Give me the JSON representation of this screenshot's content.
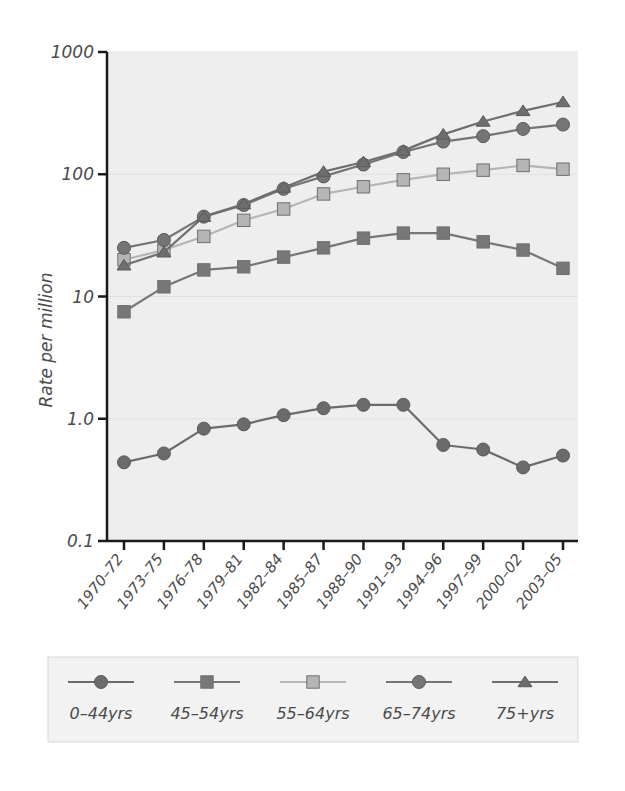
{
  "chart_data": {
    "type": "line",
    "title": "",
    "xlabel": "",
    "ylabel": "Rate per million",
    "yscale": "log",
    "ylim": [
      0.1,
      1000
    ],
    "ytick_labels": [
      "1000",
      "100",
      "10",
      "1.0",
      "0.1"
    ],
    "ytick_values": [
      1000,
      100,
      10,
      1.0,
      0.1
    ],
    "grid": true,
    "legend_position": "bottom",
    "categories": [
      "1970–72",
      "1973–75",
      "1976–78",
      "1979–81",
      "1982–84",
      "1985–87",
      "1988–90",
      "1991–93",
      "1994–96",
      "1997–99",
      "2000–02",
      "2003–05"
    ],
    "series": [
      {
        "name": "0–44yrs",
        "marker": "circle",
        "color": "#6b6b6b",
        "values": [
          0.44,
          0.52,
          0.83,
          0.9,
          1.07,
          1.22,
          1.3,
          1.3,
          0.61,
          0.56,
          0.4,
          0.5
        ]
      },
      {
        "name": "45–54yrs",
        "marker": "square",
        "color": "#777777",
        "values": [
          7.5,
          12.0,
          16.5,
          17.5,
          21.0,
          25.0,
          30.0,
          33.0,
          33.0,
          28.0,
          24.0,
          17.0
        ]
      },
      {
        "name": "55–64yrs",
        "marker": "square",
        "color": "#b5b5b5",
        "values": [
          20.0,
          24.0,
          31.0,
          42.0,
          52.0,
          69.0,
          79.0,
          90.0,
          100.0,
          108.0,
          118.0,
          110.0
        ]
      },
      {
        "name": "65–74yrs",
        "marker": "circle",
        "color": "#757575",
        "values": [
          25.0,
          29.0,
          45.0,
          56.0,
          76.0,
          96.0,
          120.0,
          152.0,
          185.0,
          205.0,
          235.0,
          255.0
        ]
      },
      {
        "name": "75+yrs",
        "marker": "triangle",
        "color": "#6e6e6e",
        "values": [
          18.0,
          23.0,
          45.0,
          57.0,
          78.0,
          105.0,
          126.0,
          156.0,
          212.0,
          270.0,
          330.0,
          390.0
        ]
      }
    ]
  },
  "legend": {
    "entries": [
      {
        "label": "0–44yrs",
        "marker": "circle",
        "color": "#6b6b6b"
      },
      {
        "label": "45–54yrs",
        "marker": "square",
        "color": "#777777"
      },
      {
        "label": "55–64yrs",
        "marker": "square",
        "color": "#b5b5b5"
      },
      {
        "label": "65–74yrs",
        "marker": "circle",
        "color": "#757575"
      },
      {
        "label": "75+yrs",
        "marker": "triangle",
        "color": "#6e6e6e"
      }
    ]
  },
  "colors": {
    "plot_background": "#eeeeee",
    "legend_background": "#f2f2f2",
    "axis": "#1a1a1a",
    "grid": "#e0e0e0",
    "text": "#4a4a4a"
  }
}
